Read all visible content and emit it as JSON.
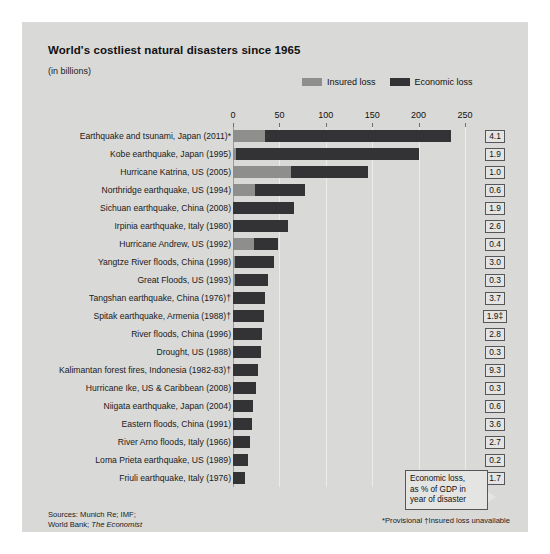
{
  "header": {
    "title": "World's costliest natural disasters since 1965",
    "subtitle": "(in billions)"
  },
  "legend": {
    "insured_label": "Insured loss",
    "economic_label": "Economic loss",
    "insured_color": "#8e8e8c",
    "economic_color": "#333335"
  },
  "callout": {
    "line1": "Economic loss,",
    "line2": "as % of GDP in",
    "line3": "year of disaster"
  },
  "sources": {
    "line1": "Sources: Munich Re; IMF;",
    "line2_prefix": "World Bank; ",
    "line2_italic": "The Economist"
  },
  "notes": {
    "text": "*Provisional  †Insured loss unavailable"
  },
  "chart_data": {
    "type": "bar",
    "title": "World's costliest natural disasters since 1965",
    "subtitle": "(in billions)",
    "orientation": "horizontal",
    "stacked": true,
    "xlabel": "",
    "ylabel": "",
    "xlim": [
      0,
      250
    ],
    "xticks": [
      0,
      50,
      100,
      150,
      200,
      250
    ],
    "xtick_labels": [
      "0",
      "50",
      "100",
      "150",
      "200",
      "250"
    ],
    "grid": true,
    "legend_position": "top-right",
    "categories": [
      "Earthquake and tsunami, Japan (2011)*",
      "Kobe earthquake, Japan (1995)",
      "Hurricane Katrina, US (2005)",
      "Northridge earthquake, US (1994)",
      "Sichuan earthquake, China (2008)",
      "Irpinia earthquake, Italy (1980)",
      "Hurricane Andrew, US (1992)",
      "Yangtze River floods, China (1998)",
      "Great Floods, US (1993)",
      "Tangshan earthquake, China (1976)†",
      "Spitak earthquake, Armenia (1988)†",
      "River floods, China (1996)",
      "Drought, US (1988)",
      "Kalimantan forest fires, Indonesia (1982-83)†",
      "Hurricane Ike, US & Caribbean (2008)",
      "Niigata earthquake, Japan (2004)",
      "Eastern floods, China (1991)",
      "River Arno floods, Italy (1966)",
      "Loma Prieta earthquake, US (1989)",
      "Friuli earthquake, Italy (1976)"
    ],
    "series": [
      {
        "name": "Insured loss",
        "color": "#8e8e8c",
        "values": [
          35,
          3,
          62,
          24,
          0,
          0,
          23,
          2,
          2,
          0,
          0,
          0,
          0,
          0,
          0,
          0,
          0,
          0,
          0,
          0
        ]
      },
      {
        "name": "Economic loss",
        "color": "#333335",
        "values": [
          235,
          200,
          146,
          78,
          66,
          59,
          48,
          44,
          38,
          35,
          33,
          31,
          30,
          27,
          25,
          22,
          20,
          18,
          16,
          13
        ]
      }
    ],
    "gdp_column_header": "Economic loss, as % of GDP in year of disaster",
    "gdp_values": [
      "4.1",
      "1.9",
      "1.0",
      "0.6",
      "1.9",
      "2.6",
      "0.4",
      "3.0",
      "0.3",
      "3.7",
      "1.9‡",
      "2.8",
      "0.3",
      "9.3",
      "0.3",
      "0.6",
      "3.6",
      "2.7",
      "0.2",
      "1.7"
    ]
  }
}
